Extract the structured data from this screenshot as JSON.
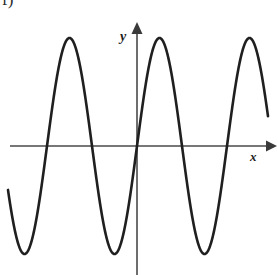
{
  "figure": {
    "label": "f)",
    "background_color": "#ffffff",
    "width": 278,
    "height": 275
  },
  "axes": {
    "x_label": "x",
    "y_label": "y",
    "axis_color": "#4a4a4a",
    "origin": {
      "x": 137,
      "y": 146
    },
    "x_axis": {
      "start_x": 10,
      "end_x": 272,
      "y": 146,
      "arrow": "right"
    },
    "y_axis": {
      "x": 137,
      "start_y": 275,
      "end_y": 26,
      "arrow": "up"
    }
  },
  "chart_data": {
    "type": "line",
    "title": "",
    "subtitle": "",
    "xlabel": "x",
    "ylabel": "y",
    "grid": false,
    "legend": "none",
    "curve_color": "#1f1f1f",
    "curve_width": 2.6,
    "function": "sine wave",
    "amplitude_px": 108,
    "period_px": 90,
    "midline_y_px": 146,
    "phase": "rising through origin",
    "x_range_px": [
      8,
      268
    ],
    "ylim_px": [
      38,
      255
    ],
    "peaks": [
      {
        "x": 70,
        "y": 38
      },
      {
        "x": 160,
        "y": 38
      },
      {
        "x": 250,
        "y": 38
      }
    ],
    "troughs": [
      {
        "x": 25,
        "y": 255
      },
      {
        "x": 115,
        "y": 255
      },
      {
        "x": 205,
        "y": 255
      }
    ],
    "zero_crossings": [
      {
        "x": 2,
        "direction": "falling"
      },
      {
        "x": 47,
        "direction": "rising"
      },
      {
        "x": 92,
        "direction": "falling"
      },
      {
        "x": 137,
        "direction": "rising"
      },
      {
        "x": 182,
        "direction": "falling"
      },
      {
        "x": 227,
        "direction": "rising"
      }
    ],
    "endpoints": {
      "left": {
        "x": 8,
        "y": 190
      },
      "right": {
        "x": 268,
        "y": 105
      }
    }
  }
}
